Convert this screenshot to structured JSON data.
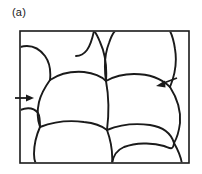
{
  "figure": {
    "panel_label": "(a)",
    "domain_type": "diagram",
    "frame": {
      "stroke_color": "#1a1a1a",
      "fill_color": "#ffffff",
      "x": 20,
      "y": 31,
      "width": 169,
      "height": 132,
      "stroke_width": 1.6
    },
    "line_style": {
      "boundary_color": "#1a1a1a",
      "boundary_width": 1.9,
      "background": "#ffffff"
    },
    "annotations": [
      {
        "name": "left-arrow",
        "direction": "right",
        "tail_x": 16,
        "tail_y": 98,
        "tip_x": 33,
        "tip_y": 98,
        "color": "#1a1a1a"
      },
      {
        "name": "right-arrow",
        "direction": "left",
        "tail_x": 176,
        "tail_y": 79,
        "tip_x": 157,
        "tip_y": 85,
        "color": "#1a1a1a"
      }
    ],
    "grain_count": 12,
    "grain_boundaries": [
      "M 20 46 C 30 44 38 47 44 54 C 50 61 51 70 50 79",
      "M 50 79 C 58 73 70 70 83 71 C 92 72 100 75 105 80",
      "M 105 80 C 106 66 104 52 99 41 C 97 36 95 33 93 31",
      "M 50 79 C 45 86 41 93 39 101 C 37 110 37 118 39 126",
      "M 39 126 C 52 121 68 119 83 121 C 93 122 101 125 106 129",
      "M 106 129 C 108 113 108 96 105 80",
      "M 20 111 C 28 108 34 109 39 114 C 41 117 40 122 39 126",
      "M 39 126 C 36 134 34 143 34 152 C 34 157 35 161 36 163",
      "M 106 129 C 110 140 112 151 111 163",
      "M 93 31 C 91 39 89 45 86 49 C 83 53 79 55 75 55",
      "M 105 80 C 112 76 122 73 133 73 C 148 73 161 78 169 86",
      "M 169 86 C 174 74 176 60 174 48 C 173 41 171 35 169 31",
      "M 105 80 C 103 66 104 52 108 42 C 110 36 112 33 114 31",
      "M 169 86 C 176 97 180 110 179 122 C 178 130 176 137 173 142",
      "M 106 129 C 118 124 134 122 149 124 C 162 126 170 132 173 142",
      "M 173 142 C 177 149 180 156 181 163",
      "M 111 163 C 112 155 116 149 123 146 C 134 142 151 141 163 145 C 169 147 172 151 173 142"
    ]
  }
}
